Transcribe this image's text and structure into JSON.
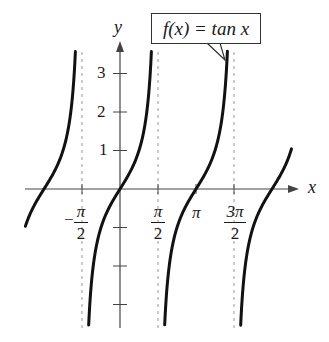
{
  "chart_data": {
    "type": "line",
    "title": "",
    "function_label": "f(x) = tan x",
    "xlabel": "x",
    "ylabel": "y",
    "x_ticks": [
      {
        "value": -1.5708,
        "label": "-π/2"
      },
      {
        "value": 1.5708,
        "label": "π/2"
      },
      {
        "value": 3.1416,
        "label": "π"
      },
      {
        "value": 4.7124,
        "label": "3π/2"
      }
    ],
    "y_ticks": [
      {
        "value": 1,
        "label": "1"
      },
      {
        "value": 2,
        "label": "2"
      },
      {
        "value": 3,
        "label": "3"
      },
      {
        "value": -1,
        "label": ""
      },
      {
        "value": -2,
        "label": ""
      },
      {
        "value": -3,
        "label": ""
      }
    ],
    "asymptotes": [
      -1.5708,
      1.5708,
      4.7124
    ],
    "xlim": [
      -3.94,
      7.3
    ],
    "ylim": [
      -3.6,
      3.7
    ],
    "grid": false,
    "series": [
      {
        "name": "tan x branch 1",
        "x_range": [
          -3.91,
          -1.844
        ]
      },
      {
        "name": "tan x branch 2",
        "x_range": [
          -1.295,
          1.298
        ]
      },
      {
        "name": "tan x branch 3",
        "x_range": [
          1.847,
          4.44
        ]
      },
      {
        "name": "tan x branch 4",
        "x_range": [
          4.988,
          7.09
        ]
      }
    ],
    "sample_points": {
      "x": [
        -3.1416,
        -2.3562,
        -0.7854,
        0,
        0.7854,
        2.3562,
        3.1416,
        3.927,
        5.4978,
        6.2832
      ],
      "y": [
        0,
        1,
        -1,
        0,
        1,
        -1,
        0,
        1,
        -1,
        0
      ]
    },
    "colors": {
      "curve": "#111111",
      "axis": "#444444",
      "asymptote": "#999999"
    }
  },
  "labels": {
    "y_axis": "y",
    "x_axis": "x",
    "callout": "f(x) = tan x",
    "y1": "1",
    "y2": "2",
    "y3": "3",
    "pi": "π",
    "two": "2",
    "three_pi": "3π",
    "minus": "−"
  }
}
